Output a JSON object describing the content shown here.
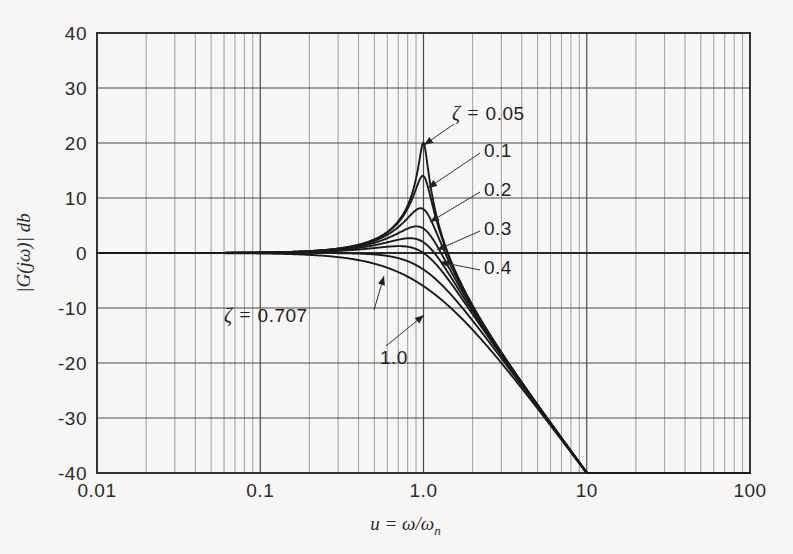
{
  "figure": {
    "background_color": "#f7f6f4",
    "grid_color": "#8d8d8d",
    "major_grid_color": "#4a4a4a",
    "curve_color": "#1a1a1a",
    "axis_color": "#333333"
  },
  "axes": {
    "x": {
      "label": "u = ω/ωn",
      "label_main": "u = ",
      "label_omega": "ω/ω",
      "label_sub": "n",
      "scale": "log",
      "min": 0.01,
      "max": 100,
      "tick_labels": [
        "0.01",
        "0.1",
        "1.0",
        "10",
        "100"
      ],
      "tick_values": [
        0.01,
        0.1,
        1.0,
        10,
        100
      ]
    },
    "y": {
      "label": "|G(jω)|  db",
      "scale": "linear",
      "min": -40,
      "max": 40,
      "tick_labels": [
        "40",
        "30",
        "20",
        "10",
        "0",
        "-10",
        "-20",
        "-30",
        "-40"
      ],
      "tick_values": [
        40,
        30,
        20,
        10,
        0,
        -10,
        -20,
        -30,
        -40
      ]
    }
  },
  "annotations": [
    {
      "id": "zeta-005",
      "text": "ζ = 0.05",
      "prefix": "ζ = ",
      "value": "0.05",
      "x": 452,
      "y": 120,
      "leader_to_x": 424,
      "leader_to_y": 145
    },
    {
      "id": "zeta-01",
      "text": "0.1",
      "prefix": "",
      "value": "0.1",
      "x": 484,
      "y": 157,
      "leader_to_x": 428,
      "leader_to_y": 188
    },
    {
      "id": "zeta-02",
      "text": "0.2",
      "prefix": "",
      "value": "0.2",
      "x": 484,
      "y": 196,
      "leader_to_x": 430,
      "leader_to_y": 222
    },
    {
      "id": "zeta-03",
      "text": "0.3",
      "prefix": "",
      "value": "0.3",
      "x": 484,
      "y": 235,
      "leader_to_x": 437,
      "leader_to_y": 250
    },
    {
      "id": "zeta-04",
      "text": "0.4",
      "prefix": "",
      "value": "0.4",
      "x": 484,
      "y": 274,
      "leader_to_x": 440,
      "leader_to_y": 262
    },
    {
      "id": "zeta-0707",
      "text": "ζ = 0.707",
      "prefix": "ζ = ",
      "value": "0.707",
      "x": 224,
      "y": 322,
      "leader_to_x": 384,
      "leader_to_y": 276
    },
    {
      "id": "zeta-10",
      "text": "1.0",
      "prefix": "",
      "value": "1.0",
      "x": 380,
      "y": 364,
      "leader_to_x": 424,
      "leader_to_y": 315
    }
  ],
  "chart_data": {
    "type": "line",
    "title": "",
    "subtitle": "",
    "xlabel": "u = ω/ωn",
    "ylabel": "|G(jω)| db",
    "xscale": "log",
    "yscale": "linear",
    "xlim": [
      0.01,
      100
    ],
    "ylim": [
      -40,
      40
    ],
    "grid": true,
    "grid_style": "log-minor-vertical + linear-horizontal",
    "legend": "inline annotations with leader lines",
    "formula": "20*log10(1/sqrt((1-u^2)^2 + (2*zeta*u)^2))",
    "series": [
      {
        "name": "ζ = 0.05",
        "zeta": 0.05,
        "peak_db": 20.0,
        "peak_u": 0.9975,
        "x": [
          0.01,
          0.02,
          0.05,
          0.1,
          0.2,
          0.3,
          0.4,
          0.5,
          0.6,
          0.7,
          0.8,
          0.9,
          0.95,
          0.99,
          1.0,
          1.05,
          1.1,
          1.2,
          1.3,
          1.5,
          2.0,
          3.0,
          5.0,
          10.0
        ],
        "values": [
          0.0,
          0.0,
          0.02,
          0.09,
          0.35,
          0.83,
          1.55,
          2.5,
          3.87,
          5.85,
          8.87,
          14.3,
          19.6,
          19.96,
          20.0,
          16.8,
          13.4,
          9.2,
          6.6,
          3.2,
          -3.5,
          -18.1,
          -27.6,
          -40.0
        ]
      },
      {
        "name": "ζ = 0.1",
        "zeta": 0.1,
        "peak_db": 14.0,
        "peak_u": 0.99,
        "x": [
          0.01,
          0.02,
          0.05,
          0.1,
          0.2,
          0.3,
          0.4,
          0.5,
          0.6,
          0.7,
          0.8,
          0.9,
          0.95,
          0.99,
          1.0,
          1.05,
          1.1,
          1.2,
          1.3,
          1.5,
          2.0,
          3.0,
          5.0,
          10.0
        ],
        "values": [
          0.0,
          0.0,
          0.02,
          0.09,
          0.35,
          0.82,
          1.53,
          2.46,
          3.77,
          5.62,
          8.13,
          11.8,
          13.4,
          14.0,
          14.0,
          12.9,
          11.2,
          8.2,
          6.1,
          3.0,
          -3.5,
          -18.1,
          -27.6,
          -40.0
        ]
      },
      {
        "name": "ζ = 0.2",
        "zeta": 0.2,
        "peak_db": 8.1,
        "peak_u": 0.96,
        "x": [
          0.01,
          0.02,
          0.05,
          0.1,
          0.2,
          0.3,
          0.4,
          0.5,
          0.6,
          0.7,
          0.8,
          0.9,
          0.95,
          1.0,
          1.05,
          1.1,
          1.2,
          1.3,
          1.5,
          2.0,
          3.0,
          5.0,
          10.0
        ],
        "values": [
          0.0,
          0.0,
          0.02,
          0.09,
          0.34,
          0.79,
          1.45,
          2.29,
          3.42,
          4.86,
          6.54,
          7.93,
          8.07,
          7.96,
          7.4,
          6.6,
          5.2,
          4.1,
          2.2,
          -3.4,
          -18.0,
          -27.6,
          -40.0
        ]
      },
      {
        "name": "ζ = 0.3",
        "zeta": 0.3,
        "peak_db": 4.8,
        "peak_u": 0.91,
        "x": [
          0.01,
          0.02,
          0.05,
          0.1,
          0.2,
          0.3,
          0.4,
          0.5,
          0.6,
          0.7,
          0.8,
          0.9,
          0.95,
          1.0,
          1.05,
          1.1,
          1.2,
          1.3,
          1.5,
          2.0,
          3.0,
          5.0,
          10.0
        ],
        "values": [
          0.0,
          0.0,
          0.02,
          0.09,
          0.33,
          0.74,
          1.32,
          2.02,
          2.89,
          3.83,
          4.62,
          4.85,
          4.72,
          4.44,
          4.0,
          3.5,
          2.6,
          1.7,
          0.3,
          -4.0,
          -17.8,
          -27.5,
          -40.0
        ]
      },
      {
        "name": "ζ = 0.4",
        "zeta": 0.4,
        "peak_db": 2.7,
        "peak_u": 0.825,
        "x": [
          0.01,
          0.02,
          0.05,
          0.1,
          0.2,
          0.3,
          0.4,
          0.5,
          0.6,
          0.7,
          0.8,
          0.9,
          0.95,
          1.0,
          1.05,
          1.1,
          1.2,
          1.3,
          1.5,
          2.0,
          3.0,
          5.0,
          10.0
        ],
        "values": [
          0.0,
          0.0,
          0.02,
          0.08,
          0.31,
          0.67,
          1.16,
          1.7,
          2.25,
          2.6,
          2.71,
          2.5,
          2.32,
          1.94,
          1.5,
          1.1,
          0.2,
          -0.7,
          -2.2,
          -5.3,
          -18.0,
          -27.5,
          -40.0
        ]
      },
      {
        "name": "ζ = 0.5",
        "zeta": 0.5,
        "peak_db": 1.25,
        "peak_u": 0.707,
        "x": [
          0.01,
          0.02,
          0.05,
          0.1,
          0.2,
          0.3,
          0.4,
          0.5,
          0.6,
          0.7,
          0.8,
          0.9,
          1.0,
          1.1,
          1.2,
          1.3,
          1.5,
          2.0,
          3.0,
          5.0,
          10.0
        ],
        "values": [
          0.0,
          0.0,
          0.01,
          0.08,
          0.28,
          0.59,
          0.96,
          1.25,
          1.31,
          1.25,
          0.93,
          0.33,
          0.0,
          -1.3,
          -2.3,
          -3.4,
          -5.1,
          -8.2,
          -18.3,
          -27.6,
          -40.0
        ]
      },
      {
        "name": "ζ = 0.707",
        "zeta": 0.707,
        "peak_db": 0.0,
        "peak_u": 0.0,
        "x": [
          0.01,
          0.02,
          0.05,
          0.1,
          0.2,
          0.3,
          0.4,
          0.5,
          0.6,
          0.7,
          0.8,
          0.9,
          1.0,
          1.1,
          1.2,
          1.3,
          1.5,
          2.0,
          3.0,
          5.0,
          10.0
        ],
        "values": [
          0.0,
          0.0,
          0.0,
          0.04,
          0.13,
          0.23,
          0.24,
          0.07,
          -0.33,
          -1.0,
          -1.9,
          -2.9,
          -3.0,
          -5.2,
          -6.5,
          -7.8,
          -10.0,
          -12.3,
          -19.1,
          -27.8,
          -40.0
        ]
      },
      {
        "name": "ζ = 1.0",
        "zeta": 1.0,
        "peak_db": 0.0,
        "peak_u": 0.0,
        "x": [
          0.01,
          0.02,
          0.05,
          0.1,
          0.2,
          0.3,
          0.4,
          0.5,
          0.6,
          0.7,
          0.8,
          0.9,
          1.0,
          1.1,
          1.2,
          1.3,
          1.5,
          2.0,
          3.0,
          5.0,
          10.0
        ],
        "values": [
          0.0,
          0.0,
          -0.01,
          -0.09,
          -0.34,
          -0.75,
          -1.29,
          -1.94,
          -2.65,
          -3.4,
          -4.16,
          -4.92,
          -6.0,
          -6.4,
          -7.1,
          -7.8,
          -10.2,
          -14.0,
          -20.0,
          -28.3,
          -40.0
        ]
      }
    ]
  }
}
